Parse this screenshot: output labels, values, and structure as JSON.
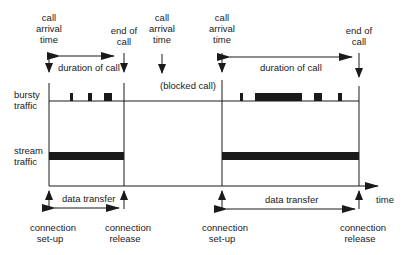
{
  "diagram": {
    "type": "timing-diagram",
    "top_labels": {
      "call_arrival_1": [
        "call",
        "arrival",
        "time"
      ],
      "end_of_call_1": [
        "end of",
        "call"
      ],
      "call_arrival_blocked": [
        "call",
        "arrival",
        "time"
      ],
      "call_arrival_2": [
        "call",
        "arrival",
        "time"
      ],
      "end_of_call_2": [
        "end of",
        "call"
      ]
    },
    "duration_label_1": "duration of call",
    "duration_label_2": "duration of call",
    "blocked_label": "(blocked call)",
    "row_labels": {
      "bursty": [
        "bursty",
        "traffic"
      ],
      "stream": [
        "stream",
        "traffic"
      ]
    },
    "axis_label": "time",
    "data_transfer_1": "data transfer",
    "data_transfer_2": "data transfer",
    "bottom_labels": {
      "setup_1": [
        "connection",
        "set-up"
      ],
      "release_1": [
        "connection",
        "release"
      ],
      "setup_2": [
        "connection",
        "set-up"
      ],
      "release_2": [
        "connection",
        "release"
      ]
    },
    "colors": {
      "ink": "#1a1a1a",
      "background": "#ffffff"
    }
  }
}
